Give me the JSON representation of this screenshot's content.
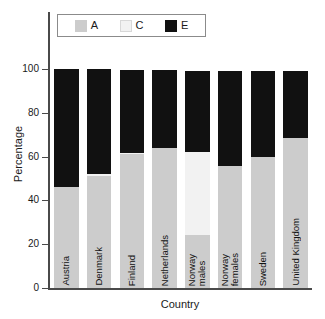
{
  "chart_data": {
    "type": "bar",
    "subtype": "stacked-bar",
    "title": "",
    "xlabel": "Country",
    "ylabel": "Percentage",
    "ylim": [
      0,
      100
    ],
    "yticks": [
      0,
      20,
      40,
      60,
      80,
      100
    ],
    "grid": false,
    "legend_position": "top",
    "categories": [
      "Austria",
      "Denmark",
      "Finland",
      "Netherlands",
      "Norway\nmales",
      "Norway\nfemales",
      "Sweden",
      "United Kingdom"
    ],
    "series": [
      {
        "name": "A",
        "color": "#cccccc",
        "values": [
          46,
          51,
          61,
          64,
          24,
          55.5,
          60,
          68.5
        ]
      },
      {
        "name": "C",
        "color": "#f2f2f2",
        "values": [
          0,
          1,
          0.5,
          0,
          38,
          0,
          0,
          0
        ]
      },
      {
        "name": "E",
        "color": "#111111",
        "values": [
          54,
          48,
          38,
          35.5,
          37,
          43.5,
          39,
          30.5
        ]
      }
    ],
    "totals": [
      100,
      100,
      99.5,
      99.5,
      99,
      99,
      99,
      99
    ]
  },
  "legend": {
    "entries": [
      {
        "label": "A",
        "color": "#cccccc",
        "swatch": "legend-swatch-a"
      },
      {
        "label": "C",
        "color": "#f2f2f2",
        "swatch": "legend-swatch-c"
      },
      {
        "label": "E",
        "color": "#111111",
        "swatch": "legend-swatch-e"
      }
    ]
  },
  "axes": {
    "y_title": "Percentage",
    "x_title": "Country",
    "y_tick_labels": [
      "100",
      "80",
      "60",
      "40",
      "20",
      "0"
    ]
  },
  "colors": {
    "series_a": "#cccccc",
    "series_c": "#f2f2f2",
    "series_e": "#111111",
    "axis": "#4a4a4a",
    "legend_border": "#8b8b8b",
    "background": "#ffffff",
    "text": "#1a1a1a"
  }
}
